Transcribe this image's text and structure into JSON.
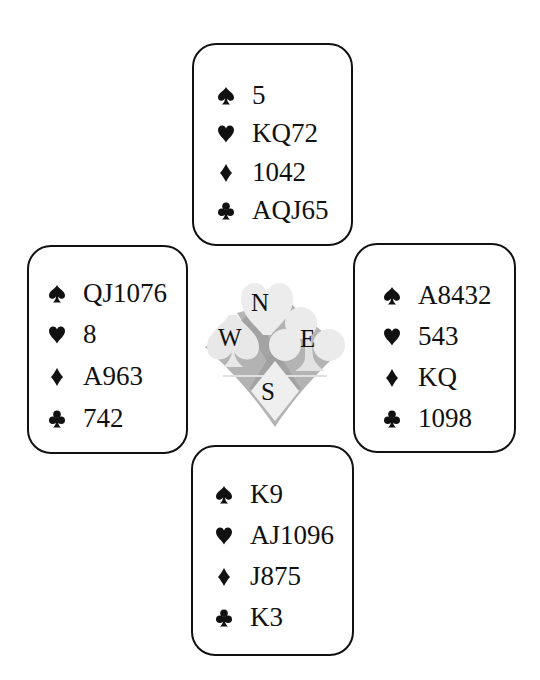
{
  "diagram": {
    "type": "bridge-deal",
    "colors": {
      "ink": "#111111",
      "background": "#ffffff",
      "compass_light": "#eeeeee",
      "compass_mid": "#c9c9c9",
      "compass_dark": "#a9a9a9"
    },
    "compass": {
      "north": "N",
      "west": "W",
      "east": "E",
      "south": "S"
    },
    "hands": {
      "north": {
        "spades": {
          "icon": "spade-icon",
          "glyph": "♠",
          "cards": "5"
        },
        "hearts": {
          "icon": "heart-icon",
          "glyph": "♥",
          "cards": "KQ72"
        },
        "diamonds": {
          "icon": "diamond-icon",
          "glyph": "♦",
          "cards": "1042"
        },
        "clubs": {
          "icon": "club-icon",
          "glyph": "♣",
          "cards": "AQJ65"
        }
      },
      "west": {
        "spades": {
          "icon": "spade-icon",
          "glyph": "♠",
          "cards": "QJ1076"
        },
        "hearts": {
          "icon": "heart-icon",
          "glyph": "♥",
          "cards": "8"
        },
        "diamonds": {
          "icon": "diamond-icon",
          "glyph": "♦",
          "cards": "A963"
        },
        "clubs": {
          "icon": "club-icon",
          "glyph": "♣",
          "cards": "742"
        }
      },
      "east": {
        "spades": {
          "icon": "spade-icon",
          "glyph": "♠",
          "cards": "A8432"
        },
        "hearts": {
          "icon": "heart-icon",
          "glyph": "♥",
          "cards": "543"
        },
        "diamonds": {
          "icon": "diamond-icon",
          "glyph": "♦",
          "cards": "KQ"
        },
        "clubs": {
          "icon": "club-icon",
          "glyph": "♣",
          "cards": "1098"
        }
      },
      "south": {
        "spades": {
          "icon": "spade-icon",
          "glyph": "♠",
          "cards": "K9"
        },
        "hearts": {
          "icon": "heart-icon",
          "glyph": "♥",
          "cards": "AJ1096"
        },
        "diamonds": {
          "icon": "diamond-icon",
          "glyph": "♦",
          "cards": "J875"
        },
        "clubs": {
          "icon": "club-icon",
          "glyph": "♣",
          "cards": "K3"
        }
      }
    }
  }
}
